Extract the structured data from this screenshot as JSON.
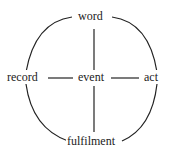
{
  "diagram": {
    "nodes": {
      "top": "word",
      "left": "record",
      "center": "event",
      "right": "act",
      "bottom": "fulfilment"
    },
    "edges": [
      [
        "word",
        "event"
      ],
      [
        "event",
        "fulfilment"
      ],
      [
        "record",
        "event"
      ],
      [
        "event",
        "act"
      ],
      [
        "word",
        "record"
      ],
      [
        "word",
        "act"
      ],
      [
        "record",
        "fulfilment"
      ],
      [
        "act",
        "fulfilment"
      ]
    ],
    "line_color": "#222222"
  }
}
